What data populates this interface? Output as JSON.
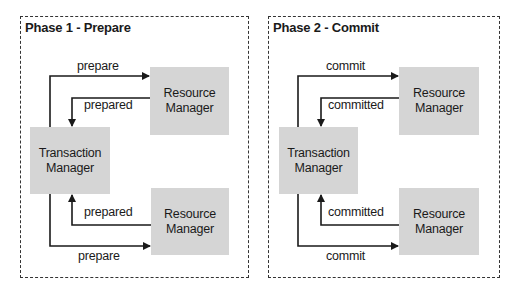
{
  "panels": [
    {
      "title": "Phase 1 - Prepare",
      "transaction_manager": [
        "Transaction",
        "Manager"
      ],
      "resource_manager_top": [
        "Resource",
        "Manager"
      ],
      "resource_manager_bottom": [
        "Resource",
        "Manager"
      ],
      "labels": {
        "top_request": "prepare",
        "top_response": "prepared",
        "bottom_response": "prepared",
        "bottom_request": "prepare"
      }
    },
    {
      "title": "Phase 2 - Commit",
      "transaction_manager": [
        "Transaction",
        "Manager"
      ],
      "resource_manager_top": [
        "Resource",
        "Manager"
      ],
      "resource_manager_bottom": [
        "Resource",
        "Manager"
      ],
      "labels": {
        "top_request": "commit",
        "top_response": "committed",
        "bottom_response": "committed",
        "bottom_request": "commit"
      }
    }
  ],
  "colors": {
    "box_fill": "#d5d5d5",
    "line": "#1a1a1a"
  }
}
